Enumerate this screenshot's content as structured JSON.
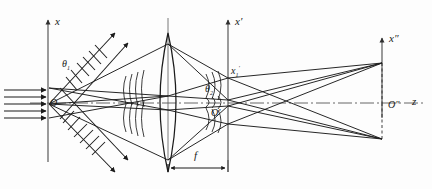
{
  "figure": {
    "kind": "optical-ray-diagram",
    "colors": {
      "stroke": "#1b1b1b",
      "axis": "#3a3a3a",
      "background": "#ffffff",
      "dashed": "#2a2a2a"
    }
  },
  "labels": {
    "axis_x": "x",
    "axis_x_prime": "x′",
    "axis_x_double_prime": "x″",
    "axis_z": "z",
    "origin_O": "O",
    "origin_O_prime": "O′",
    "origin_O_double_prime": "O″",
    "theta_1": "θ",
    "theta_1_sub": "1",
    "theta_2": "θ",
    "theta_2_sub": "2",
    "x1_prime": "x",
    "x1_prime_sub": "1",
    "x1_prime_sup": "′",
    "focal_length": "f"
  },
  "planes": {
    "input_plane_x": 48,
    "lens_plane_x": 168,
    "transform_plane_x": 228,
    "output_plane_x": 382,
    "optical_axis_y": 103
  },
  "elements": [
    {
      "name": "input-axis",
      "label": "x",
      "interactable": false
    },
    {
      "name": "transform-axis",
      "label": "x′",
      "interactable": false
    },
    {
      "name": "output-axis",
      "label": "x″",
      "interactable": false
    },
    {
      "name": "optical-axis",
      "label": "z",
      "interactable": false
    },
    {
      "name": "lens",
      "label": "converging lens",
      "interactable": false
    },
    {
      "name": "focal-length-dimension",
      "label": "f",
      "interactable": false
    }
  ]
}
